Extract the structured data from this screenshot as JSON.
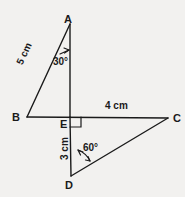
{
  "figure": {
    "type": "geometry-diagram",
    "background_color": "#f2f1ef",
    "stroke_color": "#1a1a1a",
    "vertices": [
      {
        "name": "A",
        "label": "A",
        "x": 70,
        "y": 24
      },
      {
        "name": "B",
        "label": "B",
        "x": 27,
        "y": 117
      },
      {
        "name": "C",
        "label": "C",
        "x": 168,
        "y": 118
      },
      {
        "name": "D",
        "label": "D",
        "x": 71,
        "y": 176
      },
      {
        "name": "E",
        "label": "E",
        "x": 70,
        "y": 117
      }
    ],
    "segments": [
      {
        "name": "segment-ba",
        "from": "B",
        "to": "A"
      },
      {
        "name": "segment-ae",
        "from": "A",
        "to": "E"
      },
      {
        "name": "segment-ed",
        "from": "E",
        "to": "D"
      },
      {
        "name": "segment-bc",
        "from": "B",
        "to": "C"
      },
      {
        "name": "segment-dc",
        "from": "D",
        "to": "C"
      }
    ],
    "angles": [
      {
        "name": "angle-at-a",
        "label": "30°",
        "vertex": "A"
      },
      {
        "name": "angle-at-d",
        "label": "60°",
        "vertex": "D"
      },
      {
        "name": "angle-at-e",
        "label": "right-angle",
        "vertex": "E"
      }
    ],
    "measures": [
      {
        "name": "side-ba",
        "label": "5 cm",
        "segment": "B-A",
        "orientation": "rotated"
      },
      {
        "name": "side-ec",
        "label": "4 cm",
        "segment": "E-C",
        "orientation": "horizontal"
      },
      {
        "name": "side-ed",
        "label": "3 cm",
        "segment": "E-D",
        "orientation": "rotated"
      }
    ]
  }
}
